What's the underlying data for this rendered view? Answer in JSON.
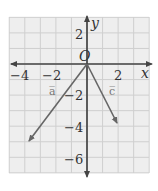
{
  "figure": {
    "x_axis_label": "x",
    "y_axis_label": "y",
    "origin_label": "O",
    "x_tick_labels": [
      {
        "value": -4,
        "text": "−4"
      },
      {
        "value": -2,
        "text": "−2"
      },
      {
        "value": 2,
        "text": "2"
      }
    ],
    "y_tick_labels": [
      {
        "value": 2,
        "text": "2"
      },
      {
        "value": -2,
        "text": "−2"
      },
      {
        "value": -4,
        "text": "−4"
      },
      {
        "value": -6,
        "text": "−6"
      }
    ],
    "grid": {
      "x_min": -5,
      "x_max": 4,
      "y_min": -7,
      "y_max": 3
    },
    "vectors": [
      {
        "name": "a",
        "label": "a̅",
        "from": [
          0,
          0
        ],
        "to": [
          -4,
          -5
        ]
      },
      {
        "name": "c",
        "label": "c̅",
        "from": [
          0,
          0
        ],
        "to": [
          2,
          -4
        ]
      }
    ],
    "colors": {
      "grid_bg": "#eeeeee",
      "grid_line": "#cfcfcf",
      "axis": "#444444",
      "vector": "#666666"
    }
  }
}
